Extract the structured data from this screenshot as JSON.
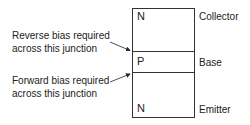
{
  "diagram": {
    "regions": [
      {
        "letter": "N",
        "name": "Collector"
      },
      {
        "letter": "P",
        "name": "Base"
      },
      {
        "letter": "N",
        "name": "Emitter"
      }
    ],
    "annotations": [
      {
        "line1": "Reverse bias required",
        "line2": "across this junction",
        "target": "collector-base junction"
      },
      {
        "line1": "Forward bias required",
        "line2": "across this junction",
        "target": "base-emitter junction"
      }
    ],
    "colors": {
      "stroke": "#333333",
      "text": "#222222",
      "background": "#ffffff"
    }
  }
}
